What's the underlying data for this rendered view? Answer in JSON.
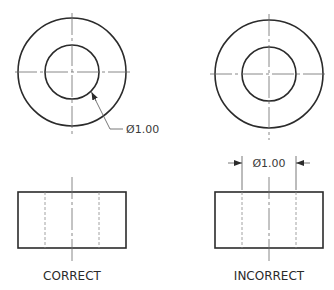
{
  "figure": {
    "left_view": {
      "caption": "CORRECT",
      "dimension_label": "Ø1.00",
      "dimension_style": "leader to inner circle in top view"
    },
    "right_view": {
      "caption": "INCORRECT",
      "dimension_label": "Ø1.00",
      "dimension_style": "linear dimension between hidden lines in front view"
    },
    "colors": {
      "line": "#2b2b2b",
      "centerline": "#6a6a6a",
      "hidden": "#8a8a8a",
      "text": "#2a2a2a"
    }
  }
}
